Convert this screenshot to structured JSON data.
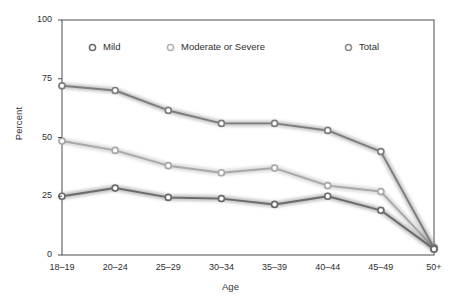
{
  "chart_data": {
    "type": "line",
    "title": "",
    "xlabel": "Age",
    "ylabel": "Percent",
    "categories": [
      "18–19",
      "20–24",
      "25–29",
      "30–34",
      "35–39",
      "40–44",
      "45–49",
      "50+"
    ],
    "ylim": [
      0,
      100
    ],
    "yticks": [
      0,
      25,
      50,
      75,
      100
    ],
    "ytick_labels": [
      "0",
      "25",
      "50",
      "75",
      "100"
    ],
    "grid": false,
    "legend_position": "top-inside",
    "series": [
      {
        "name": "Mild",
        "color": "#6b6b6b",
        "marker": "circle-open",
        "values": [
          25,
          28.5,
          24.5,
          24,
          21.5,
          25,
          19,
          2.5
        ]
      },
      {
        "name": "Moderate or Severe",
        "color": "#a8a8a8",
        "marker": "circle-open",
        "values": [
          48.5,
          44.5,
          38,
          35,
          37,
          29.5,
          27,
          3
        ]
      },
      {
        "name": "Total",
        "color": "#7d7d7d",
        "marker": "circle-open",
        "values": [
          72,
          70,
          61.5,
          56,
          56,
          53,
          44,
          3
        ]
      }
    ]
  },
  "legend": {
    "items": [
      {
        "label": "Mild",
        "marker_name": "legend-marker-mild"
      },
      {
        "label": "Moderate or Severe",
        "marker_name": "legend-marker-moderate-or-severe"
      },
      {
        "label": "Total",
        "marker_name": "legend-marker-total"
      }
    ]
  },
  "axes": {
    "y_title": "Percent",
    "x_title": "Age",
    "y_tick_labels": [
      "100",
      "75",
      "50",
      "25",
      "0"
    ],
    "x_tick_labels": [
      "18–19",
      "20–24",
      "25–29",
      "30–34",
      "35–39",
      "40–44",
      "45–49",
      "50+"
    ]
  },
  "colors": {
    "frame": "#4d4d4d",
    "mild": "#6b6b6b",
    "moderate_or_severe": "#a8a8a8",
    "total": "#7d7d7d",
    "marker_fill": "#ffffff",
    "background": "#ffffff"
  }
}
